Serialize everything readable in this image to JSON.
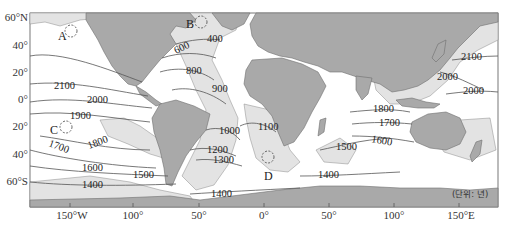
{
  "map": {
    "title": "",
    "unit_label": "(단위: 년)",
    "colors": {
      "land": "#a9a9a9",
      "shelf": "#e3e3e3",
      "ocean": "#ffffff",
      "contour": "#555555"
    },
    "axes": {
      "latitude_labels": [
        {
          "label": "60°N",
          "y": 18
        },
        {
          "label": "40°",
          "y": 46
        },
        {
          "label": "20°",
          "y": 73
        },
        {
          "label": "0°",
          "y": 100
        },
        {
          "label": "20°",
          "y": 127
        },
        {
          "label": "40°",
          "y": 155
        },
        {
          "label": "60°S",
          "y": 182
        }
      ],
      "longitude_labels": [
        {
          "label": "150°W",
          "x": 70
        },
        {
          "label": "100°",
          "x": 133
        },
        {
          "label": "50°",
          "x": 199
        },
        {
          "label": "0°",
          "x": 264
        },
        {
          "label": "50°",
          "x": 329
        },
        {
          "label": "100°",
          "x": 394
        },
        {
          "label": "150°E",
          "x": 459
        }
      ]
    },
    "points": [
      {
        "id": "A",
        "label": "A",
        "x": 58,
        "y": 36,
        "cx": 71,
        "cy": 31
      },
      {
        "id": "B",
        "label": "B",
        "x": 186,
        "y": 24,
        "cx": 201,
        "cy": 22
      },
      {
        "id": "C",
        "label": "C",
        "x": 50,
        "y": 130,
        "cx": 66,
        "cy": 127
      },
      {
        "id": "D",
        "label": "D",
        "x": 265,
        "y": 176,
        "cx": 268,
        "cy": 157
      }
    ],
    "contour_labels": [
      {
        "value": "2100",
        "x": 54,
        "y": 86
      },
      {
        "value": "2000",
        "x": 87,
        "y": 100
      },
      {
        "value": "1900",
        "x": 70,
        "y": 116
      },
      {
        "value": "1800",
        "x": 89,
        "y": 146,
        "rotate": -20
      },
      {
        "value": "1700",
        "x": 38,
        "y": 150,
        "rotate": 20
      },
      {
        "value": "1600",
        "x": 82,
        "y": 168
      },
      {
        "value": "1500",
        "x": 133,
        "y": 175
      },
      {
        "value": "1400",
        "x": 82,
        "y": 185
      },
      {
        "value": "600",
        "x": 176,
        "y": 54,
        "rotate": -25
      },
      {
        "value": "400",
        "x": 206,
        "y": 41
      },
      {
        "value": "800",
        "x": 186,
        "y": 73
      },
      {
        "value": "900",
        "x": 212,
        "y": 91
      },
      {
        "value": "1000",
        "x": 219,
        "y": 133
      },
      {
        "value": "1100",
        "x": 258,
        "y": 129
      },
      {
        "value": "1200",
        "x": 207,
        "y": 152
      },
      {
        "value": "1300",
        "x": 213,
        "y": 161
      },
      {
        "value": "1400",
        "x": 211,
        "y": 196
      },
      {
        "value": "1400",
        "x": 318,
        "y": 178
      },
      {
        "value": "1500",
        "x": 336,
        "y": 150
      },
      {
        "value": "1800",
        "x": 373,
        "y": 111
      },
      {
        "value": "1700",
        "x": 379,
        "y": 125
      },
      {
        "value": "1600",
        "x": 371,
        "y": 140,
        "rotate": 10
      },
      {
        "value": "2100",
        "x": 462,
        "y": 60
      },
      {
        "value": "2000",
        "x": 437,
        "y": 80
      },
      {
        "value": "2000",
        "x": 464,
        "y": 93
      }
    ]
  }
}
